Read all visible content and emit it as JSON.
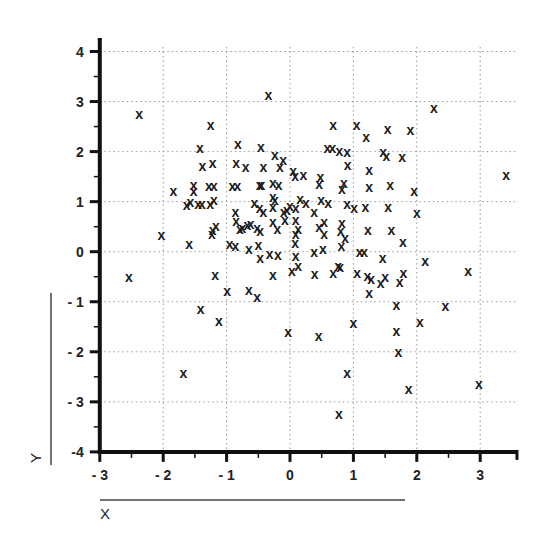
{
  "chart_data": {
    "type": "scatter",
    "title": "",
    "xlabel": "X",
    "ylabel": "Y",
    "xlim": [
      -3,
      3.58
    ],
    "ylim": [
      -4,
      4.25
    ],
    "xticks": [
      -3,
      -2,
      -1,
      0,
      1,
      2,
      3
    ],
    "yticks": [
      -4,
      -3,
      -2,
      -1,
      0,
      1,
      2,
      3,
      4
    ],
    "xtick_labels": [
      "- 3",
      "- 2",
      "- 1",
      "0",
      "1",
      "2",
      "3"
    ],
    "ytick_labels": [
      "-4",
      "- 3",
      "- 2",
      "- 1",
      "0",
      "1",
      "2",
      "3",
      "4"
    ],
    "grid": true,
    "grid_style": "dotted",
    "marker": "x",
    "legend": null,
    "series": [
      {
        "name": "points",
        "points": [
          [
            -2.38,
            2.75
          ],
          [
            -1.25,
            2.53
          ],
          [
            -1.42,
            2.07
          ],
          [
            -0.82,
            2.15
          ],
          [
            -0.46,
            2.09
          ],
          [
            -0.34,
            3.14
          ],
          [
            0.59,
            2.07
          ],
          [
            0.67,
            2.07
          ],
          [
            0.78,
            2.01
          ],
          [
            0.9,
            1.99
          ],
          [
            -0.24,
            1.93
          ],
          [
            0.68,
            2.53
          ],
          [
            1.05,
            2.53
          ],
          [
            1.2,
            2.29
          ],
          [
            1.54,
            2.45
          ],
          [
            1.9,
            2.43
          ],
          [
            2.27,
            2.87
          ],
          [
            1.47,
            1.99
          ],
          [
            1.52,
            1.91
          ],
          [
            1.77,
            1.89
          ],
          [
            0.91,
            1.73
          ],
          [
            1.25,
            1.63
          ],
          [
            3.41,
            1.53
          ],
          [
            1.96,
            1.21
          ],
          [
            2.0,
            0.77
          ],
          [
            -1.38,
            1.71
          ],
          [
            -1.22,
            1.77
          ],
          [
            -0.85,
            1.77
          ],
          [
            -0.7,
            1.69
          ],
          [
            -0.42,
            1.69
          ],
          [
            -0.16,
            1.69
          ],
          [
            -0.11,
            1.83
          ],
          [
            0.05,
            1.61
          ],
          [
            0.08,
            1.51
          ],
          [
            0.21,
            1.53
          ],
          [
            0.48,
            1.49
          ],
          [
            0.46,
            1.35
          ],
          [
            -1.84,
            1.21
          ],
          [
            -1.52,
            1.33
          ],
          [
            -1.52,
            1.21
          ],
          [
            -1.28,
            1.31
          ],
          [
            -1.2,
            1.31
          ],
          [
            -0.91,
            1.31
          ],
          [
            -0.83,
            1.31
          ],
          [
            -0.48,
            1.33
          ],
          [
            -0.45,
            1.33
          ],
          [
            -0.27,
            1.37
          ],
          [
            -0.18,
            1.33
          ],
          [
            -1.63,
            0.93
          ],
          [
            -1.57,
            0.99
          ],
          [
            -1.45,
            0.95
          ],
          [
            -1.39,
            0.95
          ],
          [
            -1.26,
            0.95
          ],
          [
            -1.2,
            1.03
          ],
          [
            -0.27,
            1.1
          ],
          [
            -0.24,
            1.03
          ],
          [
            -0.27,
            0.9
          ],
          [
            -0.56,
            0.97
          ],
          [
            -0.48,
            0.87
          ],
          [
            -0.42,
            0.79
          ],
          [
            -0.1,
            0.79
          ],
          [
            -0.05,
            0.83
          ],
          [
            0.0,
            0.91
          ],
          [
            0.09,
            0.87
          ],
          [
            0.16,
            1.05
          ],
          [
            0.25,
            0.97
          ],
          [
            0.38,
            0.79
          ],
          [
            0.85,
            1.37
          ],
          [
            0.82,
            1.25
          ],
          [
            1.25,
            1.29
          ],
          [
            1.58,
            1.33
          ],
          [
            0.49,
            1.03
          ],
          [
            0.6,
            0.97
          ],
          [
            0.9,
            0.95
          ],
          [
            1.01,
            0.87
          ],
          [
            1.19,
            0.89
          ],
          [
            1.55,
            0.89
          ],
          [
            -0.86,
            0.79
          ],
          [
            -0.85,
            0.62
          ],
          [
            -0.79,
            0.46
          ],
          [
            -0.62,
            0.56
          ],
          [
            -0.52,
            0.48
          ],
          [
            -0.47,
            0.42
          ],
          [
            -0.27,
            0.6
          ],
          [
            -0.2,
            0.46
          ],
          [
            -0.08,
            0.64
          ],
          [
            0.09,
            0.64
          ],
          [
            0.13,
            0.46
          ],
          [
            0.46,
            0.5
          ],
          [
            0.54,
            0.6
          ],
          [
            -1.22,
            0.44
          ],
          [
            -1.17,
            0.52
          ],
          [
            -1.23,
            0.36
          ],
          [
            -0.75,
            0.48
          ],
          [
            -0.67,
            0.54
          ],
          [
            0.8,
            0.42
          ],
          [
            0.82,
            0.58
          ],
          [
            0.87,
            0.28
          ],
          [
            0.81,
            0.12
          ],
          [
            1.23,
            0.44
          ],
          [
            1.6,
            0.44
          ],
          [
            1.78,
            0.2
          ],
          [
            -2.03,
            0.34
          ],
          [
            -1.59,
            0.15
          ],
          [
            -0.95,
            0.15
          ],
          [
            -0.86,
            0.12
          ],
          [
            -0.65,
            0.05
          ],
          [
            -0.5,
            0.13
          ],
          [
            -0.47,
            -0.13
          ],
          [
            -0.32,
            -0.05
          ],
          [
            -0.19,
            -0.07
          ],
          [
            0.08,
            0.17
          ],
          [
            0.09,
            0.35
          ],
          [
            0.09,
            -0.09
          ],
          [
            0.54,
            0.35
          ],
          [
            0.52,
            0.05
          ],
          [
            0.38,
            0.0
          ],
          [
            1.1,
            0.0
          ],
          [
            1.17,
            0.0
          ],
          [
            1.46,
            -0.12
          ],
          [
            2.13,
            -0.18
          ],
          [
            0.79,
            -0.3
          ],
          [
            1.06,
            -0.42
          ],
          [
            1.79,
            -0.42
          ],
          [
            2.81,
            -0.38
          ],
          [
            1.22,
            -0.48
          ],
          [
            1.28,
            -0.54
          ],
          [
            1.5,
            -0.5
          ],
          [
            1.43,
            -0.62
          ],
          [
            1.73,
            -0.6
          ],
          [
            1.25,
            -0.82
          ],
          [
            0.03,
            -0.38
          ],
          [
            0.13,
            -0.28
          ],
          [
            0.39,
            -0.45
          ],
          [
            0.68,
            -0.43
          ],
          [
            0.76,
            -0.29
          ],
          [
            -2.54,
            -0.5
          ],
          [
            -1.18,
            -0.47
          ],
          [
            -0.27,
            -0.47
          ],
          [
            -0.99,
            -0.79
          ],
          [
            -0.65,
            -0.77
          ],
          [
            -0.52,
            -0.91
          ],
          [
            -1.41,
            -1.15
          ],
          [
            -1.12,
            -1.39
          ],
          [
            -1.68,
            -2.43
          ],
          [
            -0.03,
            -1.61
          ],
          [
            0.45,
            -1.69
          ],
          [
            1.0,
            -1.43
          ],
          [
            1.68,
            -1.07
          ],
          [
            2.45,
            -1.09
          ],
          [
            1.68,
            -1.59
          ],
          [
            1.71,
            -2.0
          ],
          [
            2.05,
            -1.41
          ],
          [
            0.9,
            -2.43
          ],
          [
            1.87,
            -2.75
          ],
          [
            2.98,
            -2.65
          ],
          [
            0.77,
            -3.24
          ]
        ]
      }
    ]
  },
  "labels": {
    "x_axis_title": "X",
    "y_axis_title": "Y"
  }
}
